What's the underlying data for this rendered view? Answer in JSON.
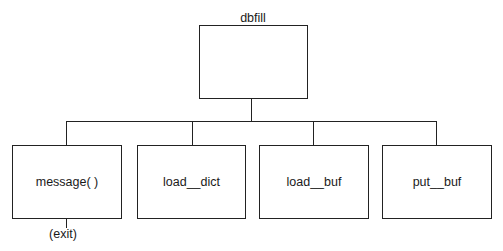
{
  "diagram": {
    "type": "call-hierarchy",
    "root": {
      "label": "dbfill"
    },
    "children": [
      {
        "label": "message( )",
        "note": "(exit)"
      },
      {
        "label": "load__dict"
      },
      {
        "label": "load__buf"
      },
      {
        "label": "put__buf"
      }
    ]
  }
}
